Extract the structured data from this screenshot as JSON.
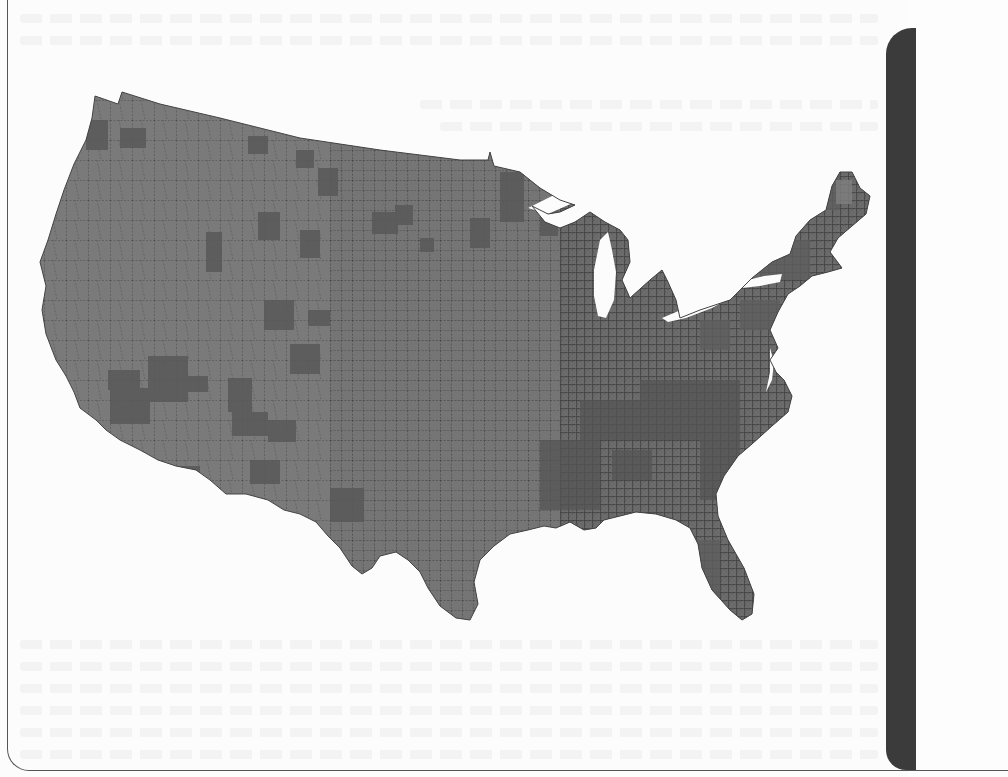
{
  "page": {
    "background": "#fcfcfc",
    "frame_color": "#555555",
    "side_bar_color": "#3b3b3b"
  },
  "map": {
    "subject": "Contiguous United States county-level choropleth",
    "palette": {
      "base_fill": "#7a7a7a",
      "dark_fill": "#5e5e5e",
      "darker_fill": "#545454",
      "county_border": "#333333",
      "water": "#fcfcfc"
    },
    "legend": null,
    "labels": []
  }
}
